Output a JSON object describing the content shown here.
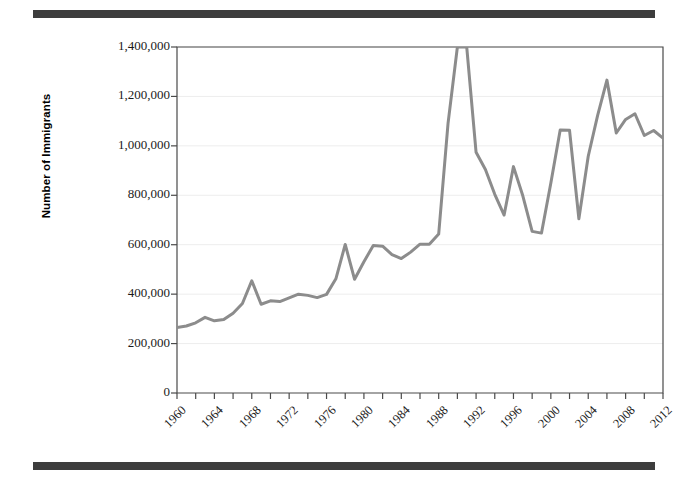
{
  "figure": {
    "top_rule": "decorative-rule",
    "bottom_rule": "decorative-rule",
    "line_color": "#8c8c8c",
    "axis_color": "#4a4a4a",
    "grid_color": "#ededed",
    "background": "#ffffff"
  },
  "chart_data": {
    "type": "line",
    "title": "",
    "xlabel": "",
    "ylabel": "Number of Immigrants",
    "xlim": [
      1960,
      2012
    ],
    "ylim": [
      0,
      1400000
    ],
    "grid": true,
    "legend": "none",
    "y_ticks": [
      0,
      200000,
      400000,
      600000,
      800000,
      1000000,
      1200000,
      1400000
    ],
    "y_tick_labels": [
      "0",
      "200,000",
      "400,000",
      "600,000",
      "800,000",
      "1,000,000",
      "1,200,000",
      "1,400,000"
    ],
    "x_ticks": [
      1960,
      1962,
      1964,
      1966,
      1968,
      1970,
      1972,
      1974,
      1976,
      1978,
      1980,
      1982,
      1984,
      1986,
      1988,
      1990,
      1992,
      1994,
      1996,
      1998,
      2000,
      2002,
      2004,
      2006,
      2008,
      2010,
      2012
    ],
    "x_tick_labels": [
      "1960",
      "1964",
      "1968",
      "1972",
      "1976",
      "1980",
      "1984",
      "1988",
      "1992",
      "1996",
      "2000",
      "2004",
      "2008",
      "2012"
    ],
    "x_tick_label_years": [
      1960,
      1964,
      1968,
      1972,
      1976,
      1980,
      1984,
      1988,
      1992,
      1996,
      2000,
      2004,
      2008,
      2012
    ],
    "series": [
      {
        "name": "Number of Immigrants",
        "color": "#8c8c8c",
        "x": [
          1960,
          1961,
          1962,
          1963,
          1964,
          1965,
          1966,
          1967,
          1968,
          1969,
          1970,
          1971,
          1972,
          1973,
          1974,
          1975,
          1976,
          1977,
          1978,
          1979,
          1980,
          1981,
          1982,
          1983,
          1984,
          1985,
          1986,
          1987,
          1988,
          1989,
          1990,
          1991,
          1992,
          1993,
          1994,
          1995,
          1996,
          1997,
          1998,
          1999,
          2000,
          2001,
          2002,
          2003,
          2004,
          2005,
          2006,
          2007,
          2008,
          2009,
          2010,
          2011,
          2012
        ],
        "values": [
          265000,
          271000,
          284000,
          306000,
          292000,
          297000,
          323000,
          362000,
          454000,
          359000,
          373000,
          370000,
          385000,
          400000,
          395000,
          386000,
          399000,
          462000,
          601000,
          460000,
          531000,
          597000,
          594000,
          560000,
          544000,
          570000,
          602000,
          602000,
          643000,
          1091000,
          1536000,
          1827000,
          974000,
          904000,
          804000,
          720000,
          916000,
          798000,
          654000,
          647000,
          850000,
          1064000,
          1063000,
          705000,
          958000,
          1122000,
          1266000,
          1052000,
          1107000,
          1130000,
          1042000,
          1062000,
          1031000
        ]
      }
    ],
    "plot_box": {
      "left": 177,
      "top": 47,
      "right": 663,
      "bottom": 393
    }
  }
}
